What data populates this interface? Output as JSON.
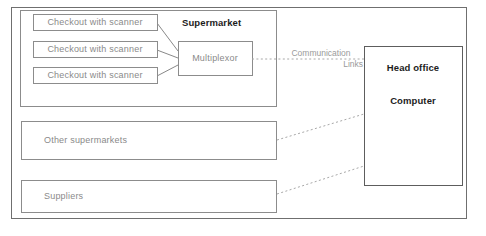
{
  "diagram": {
    "outer_frame": {
      "name": "outer-frame"
    },
    "groups": [
      {
        "id": "supermarket",
        "label": "Supermarket"
      }
    ],
    "nodes": [
      {
        "id": "checkout-1",
        "label": "Checkout with scanner"
      },
      {
        "id": "checkout-2",
        "label": "Checkout with scanner"
      },
      {
        "id": "checkout-3",
        "label": "Checkout with scanner"
      },
      {
        "id": "multiplexor",
        "label": "Multiplexor"
      },
      {
        "id": "other-supermarkets",
        "label": "Other supermarkets"
      },
      {
        "id": "suppliers",
        "label": "Suppliers"
      },
      {
        "id": "head-office",
        "label_line_1": "Head office",
        "label_line_2": "Computer"
      }
    ],
    "links": [
      {
        "id": "comm-links",
        "label_line_1": "Communication",
        "label_line_2": "Links",
        "style": "dotted"
      },
      {
        "id": "other-supermarkets-link",
        "style": "dotted"
      },
      {
        "id": "suppliers-link",
        "style": "dotted"
      }
    ],
    "colors": {
      "box_stroke": "#8c8c8c",
      "frame_stroke": "#6f6f6f",
      "connector_stroke": "#7a7a7a",
      "dotted_stroke": "#a8a8a8",
      "text_muted": "#8a8a8a",
      "text_dark": "#1c1c1c",
      "background": "#ffffff"
    }
  }
}
